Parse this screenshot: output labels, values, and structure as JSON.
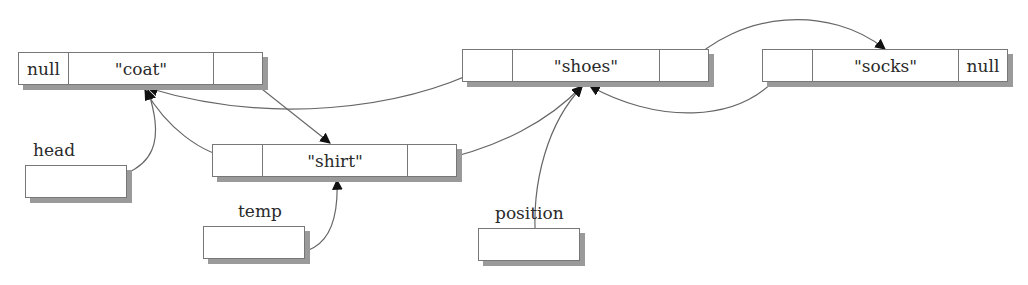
{
  "diagram": {
    "type": "doubly-linked-list",
    "nodes": [
      {
        "id": "coat",
        "prev": "null",
        "value": "\"coat\"",
        "next": ""
      },
      {
        "id": "shirt",
        "prev": "",
        "value": "\"shirt\"",
        "next": ""
      },
      {
        "id": "shoes",
        "prev": "",
        "value": "\"shoes\"",
        "next": ""
      },
      {
        "id": "socks",
        "prev": "",
        "value": "\"socks\"",
        "next": "null"
      }
    ],
    "variables": [
      {
        "id": "head",
        "label": "head",
        "points_to": "coat"
      },
      {
        "id": "temp",
        "label": "temp",
        "points_to": "shirt"
      },
      {
        "id": "position",
        "label": "position",
        "points_to": "shoes"
      }
    ],
    "edges": [
      {
        "from": "coat.next",
        "to": "shirt"
      },
      {
        "from": "shirt.prev",
        "to": "coat"
      },
      {
        "from": "shirt.next",
        "to": "shoes"
      },
      {
        "from": "shoes.prev",
        "to": "coat"
      },
      {
        "from": "shoes.next",
        "to": "socks"
      },
      {
        "from": "socks.prev",
        "to": "shoes"
      },
      {
        "from": "head",
        "to": "coat"
      },
      {
        "from": "temp",
        "to": "shirt"
      },
      {
        "from": "position",
        "to": "shoes"
      }
    ],
    "colors": {
      "line": "#666666",
      "border": "#777777",
      "shadow": "#9a9a9a"
    }
  }
}
